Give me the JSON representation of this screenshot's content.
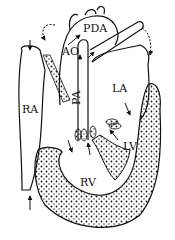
{
  "diagram": {
    "labels": {
      "pda": "PDA",
      "ao": "AO",
      "pa": "PA",
      "la": "LA",
      "ra": "RA",
      "lv": "LV",
      "rv": "RV"
    }
  }
}
